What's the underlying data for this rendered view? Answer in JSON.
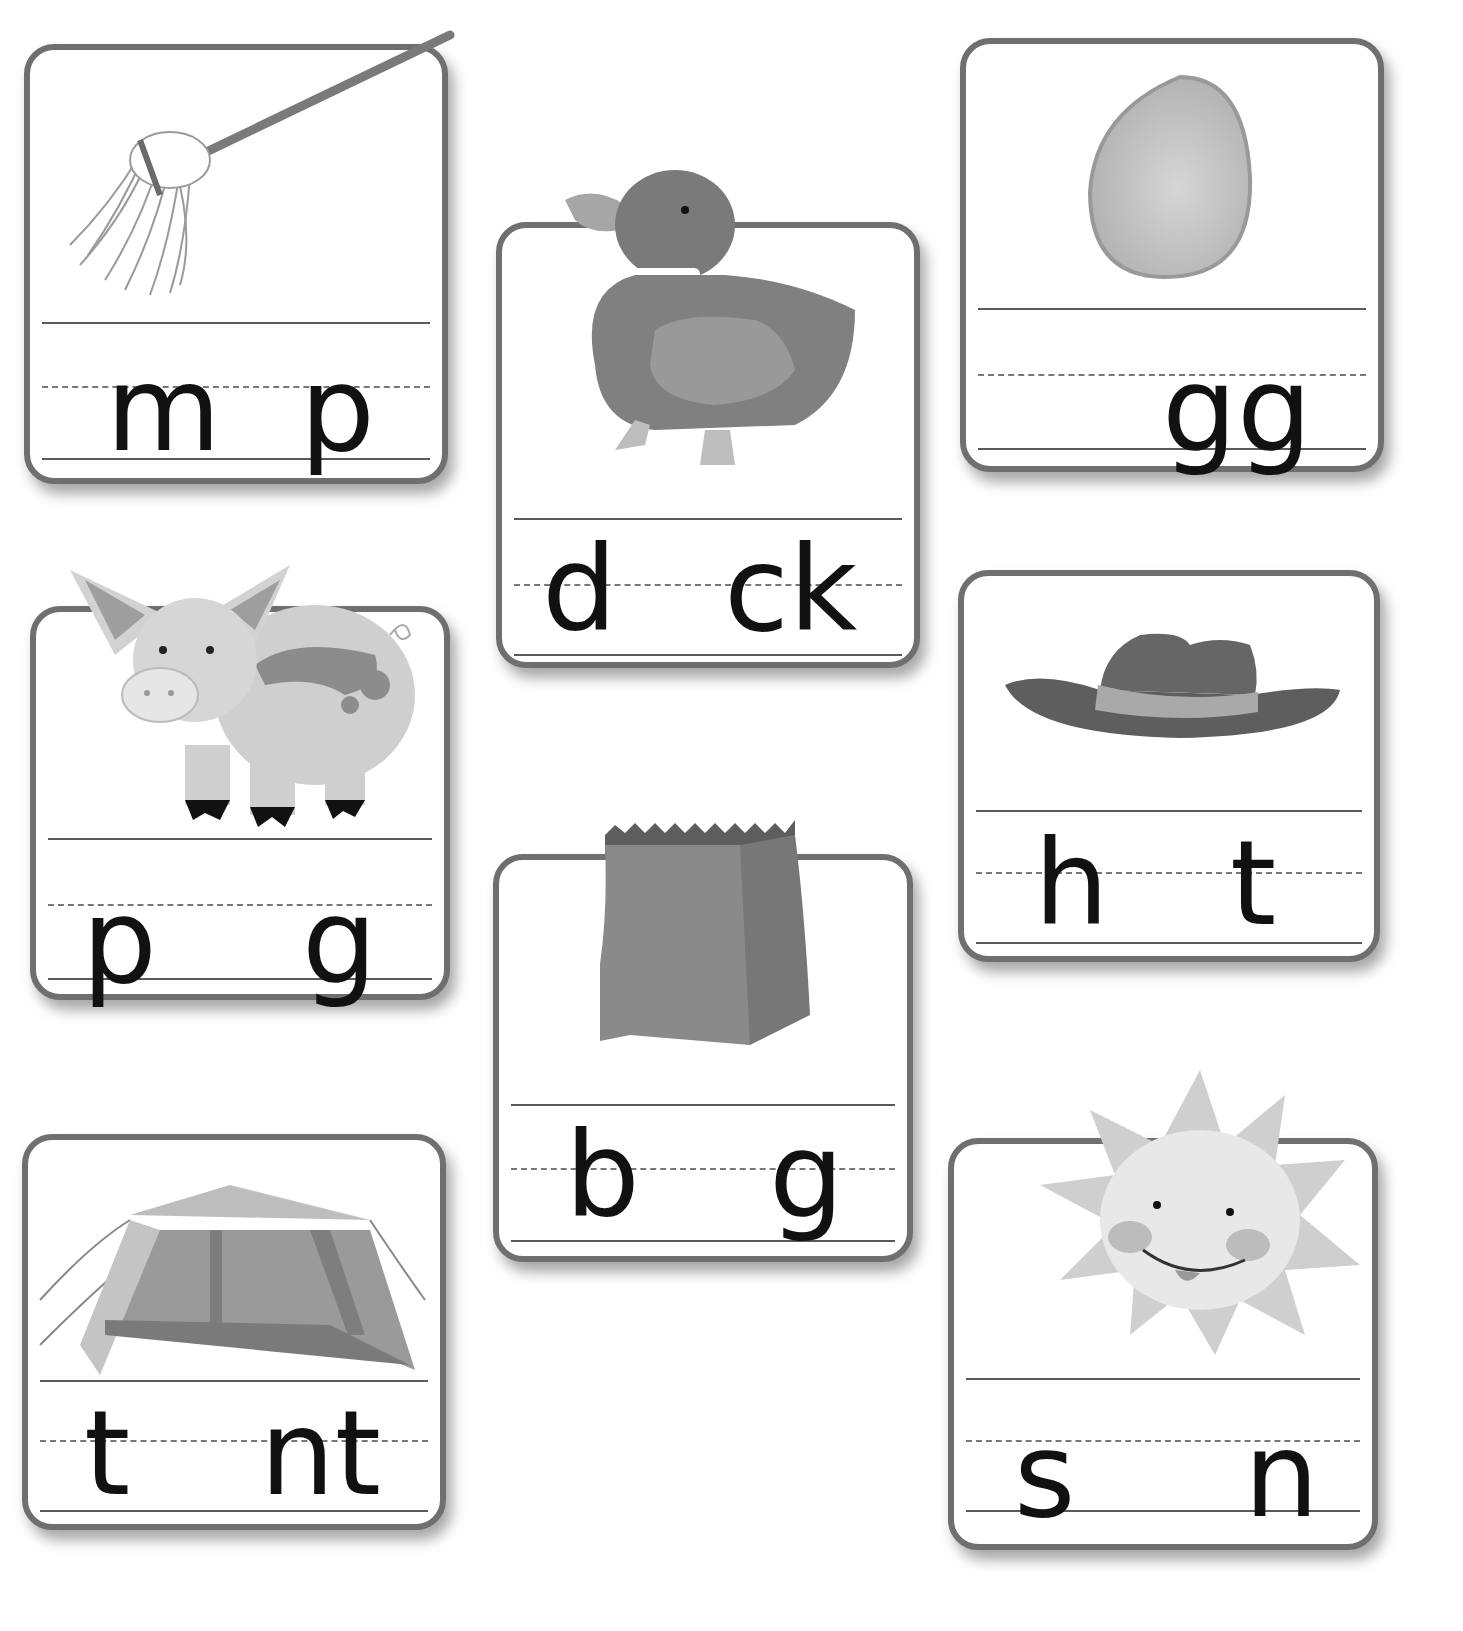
{
  "worksheet": {
    "cards": [
      {
        "id": "mop",
        "picture": "mop-icon",
        "first": "m",
        "last": "p",
        "missing_vowel_position": "middle"
      },
      {
        "id": "duck",
        "picture": "duck-icon",
        "first": "d",
        "last": "ck",
        "missing_vowel_position": "middle"
      },
      {
        "id": "egg",
        "picture": "egg-icon",
        "first": "",
        "last": "gg",
        "missing_vowel_position": "start"
      },
      {
        "id": "pig",
        "picture": "pig-icon",
        "first": "p",
        "last": "g",
        "missing_vowel_position": "middle"
      },
      {
        "id": "hat",
        "picture": "hat-icon",
        "first": "h",
        "last": "t",
        "missing_vowel_position": "middle"
      },
      {
        "id": "bag",
        "picture": "bag-icon",
        "first": "b",
        "last": "g",
        "missing_vowel_position": "middle"
      },
      {
        "id": "tent",
        "picture": "tent-icon",
        "first": "t",
        "last": "nt",
        "missing_vowel_position": "middle"
      },
      {
        "id": "sun",
        "picture": "sun-icon",
        "first": "s",
        "last": "n",
        "missing_vowel_position": "middle"
      }
    ],
    "colors": {
      "card_border": "#6f6f6f",
      "ink": "#111111",
      "illustration_dark": "#6e6e6e",
      "illustration_mid": "#9a9a9a",
      "illustration_light": "#c9c9c9"
    }
  }
}
